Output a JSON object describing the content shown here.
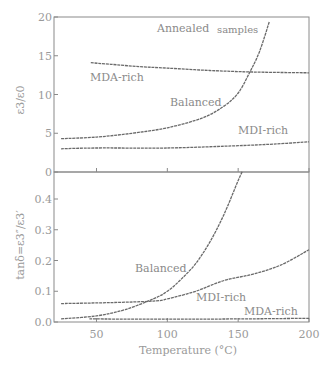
{
  "chart_data": [
    {
      "type": "line",
      "panel": "top",
      "title": "Annealed samples",
      "xlabel": "Temperature (°C)",
      "ylabel": "ε3/ε0",
      "xlim": [
        20,
        200
      ],
      "ylim": [
        0,
        20
      ],
      "yticks": [
        0,
        5,
        10,
        15,
        20
      ],
      "ytick_labels": [
        "0",
        "5",
        "10",
        "15",
        "20"
      ],
      "xticks": [
        50,
        100,
        150,
        200
      ],
      "grid": false,
      "series": [
        {
          "name": "MDA-rich",
          "x": [
            46,
            60,
            80,
            100,
            130,
            160,
            200
          ],
          "values": [
            14.1,
            13.9,
            13.6,
            13.4,
            13.1,
            12.9,
            12.8
          ]
        },
        {
          "name": "Balanced",
          "x": [
            25,
            50,
            75,
            100,
            125,
            140,
            150,
            158,
            165,
            172
          ],
          "values": [
            4.3,
            4.5,
            5.0,
            5.7,
            7.0,
            8.5,
            10.2,
            12.8,
            15.5,
            19.4
          ]
        },
        {
          "name": "MDI-rich",
          "x": [
            25,
            50,
            100,
            150,
            175,
            200
          ],
          "values": [
            3.0,
            3.1,
            3.1,
            3.4,
            3.6,
            3.9
          ]
        }
      ],
      "annotations": [
        {
          "text": "Annealed samples",
          "x": 150,
          "y": 19
        },
        {
          "text": "MDA-rich",
          "x": 52,
          "y": 12
        },
        {
          "text": "Balanced",
          "x": 115,
          "y": 8
        },
        {
          "text": "MDI-rich",
          "x": 165,
          "y": 4.8
        }
      ]
    },
    {
      "type": "line",
      "panel": "bottom",
      "xlabel": "Temperature (°C)",
      "ylabel": "tanδ=ε3″/ε3′",
      "xlim": [
        20,
        200
      ],
      "ylim": [
        0,
        0.49
      ],
      "yticks": [
        0.0,
        0.1,
        0.2,
        0.3,
        0.4
      ],
      "ytick_labels": [
        "0.0",
        "0.1",
        "0.2",
        "0.3",
        "0.4"
      ],
      "xticks": [
        50,
        100,
        150,
        200
      ],
      "xtick_labels": [
        "50",
        "100",
        "150",
        "200"
      ],
      "grid": false,
      "series": [
        {
          "name": "Balanced",
          "x": [
            25,
            50,
            70,
            90,
            100,
            110,
            120,
            130,
            140,
            150,
            153
          ],
          "values": [
            0.01,
            0.02,
            0.04,
            0.075,
            0.1,
            0.14,
            0.19,
            0.26,
            0.35,
            0.46,
            0.49
          ]
        },
        {
          "name": "MDI-rich",
          "x": [
            25,
            60,
            90,
            100,
            120,
            140,
            160,
            180,
            200
          ],
          "values": [
            0.06,
            0.063,
            0.068,
            0.075,
            0.1,
            0.135,
            0.155,
            0.185,
            0.235
          ]
        },
        {
          "name": "MDA-rich",
          "x": [
            45,
            100,
            150,
            200
          ],
          "values": [
            0.01,
            0.009,
            0.01,
            0.012
          ]
        }
      ],
      "annotations": [
        {
          "text": "Balanced",
          "x": 82,
          "y": 0.17
        },
        {
          "text": "MDI-rich",
          "x": 127,
          "y": 0.05
        },
        {
          "text": "MDA-rich",
          "x": 170,
          "y": 0.02
        }
      ]
    }
  ],
  "labels": {
    "top_title_a": "Annealed",
    "top_title_b": "samples",
    "top_ylabel": "ε3/ε0",
    "bottom_ylabel": "tanδ=ε3″/ε3′",
    "xlabel": "Temperature (°C)",
    "top_mda": "MDA-rich",
    "top_balanced": "Balanced",
    "top_mdi": "MDI-rich",
    "bottom_balanced": "Balanced",
    "bottom_mdi": "MDI-rich",
    "bottom_mda": "MDA-rich"
  }
}
